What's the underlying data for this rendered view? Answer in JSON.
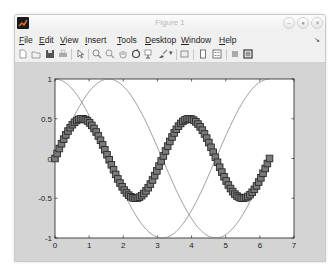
{
  "window": {
    "title": "Figure 1",
    "controls": [
      "minimize",
      "maximize",
      "close"
    ]
  },
  "menu": {
    "items": [
      {
        "label": "File",
        "accel": "F"
      },
      {
        "label": "Edit",
        "accel": "E"
      },
      {
        "label": "View",
        "accel": "V"
      },
      {
        "label": "Insert",
        "accel": "I"
      },
      {
        "label": "Tools",
        "accel": "T"
      },
      {
        "label": "Desktop",
        "accel": "D"
      },
      {
        "label": "Window",
        "accel": "W"
      },
      {
        "label": "Help",
        "accel": "H"
      }
    ],
    "dock_icon": "undock-arrow-icon"
  },
  "toolbar": {
    "items": [
      "new-figure-icon",
      "open-file-icon",
      "save-icon",
      "print-icon",
      "edit-plot-arrow-icon",
      "zoom-in-icon",
      "zoom-out-icon",
      "pan-hand-icon",
      "rotate-3d-icon",
      "data-cursor-icon",
      "brush-icon",
      "link-plot-icon",
      "colorbar-icon",
      "legend-icon",
      "hide-plot-tools-icon",
      "show-plot-tools-icon"
    ]
  },
  "chart_data": {
    "type": "line",
    "title": "",
    "xlabel": "",
    "ylabel": "",
    "xlim": [
      0,
      7
    ],
    "ylim": [
      -1,
      1
    ],
    "xticks": [
      0,
      1,
      2,
      3,
      4,
      5,
      6,
      7
    ],
    "yticks": [
      -1,
      -0.5,
      0,
      0.5,
      1
    ],
    "ytick_labels": [
      "-1",
      "-0.5",
      "0",
      "0.5",
      "1"
    ],
    "grid": false,
    "legend": null,
    "x_range": {
      "start": 0,
      "end": 6.2832,
      "samples": 100
    },
    "series": [
      {
        "name": "sin(x)",
        "style": "line",
        "color": "#777777",
        "expr": "sin",
        "peak": [
          1.5708,
          1
        ],
        "trough": [
          4.7124,
          -1
        ]
      },
      {
        "name": "cos(x)",
        "style": "line",
        "color": "#777777",
        "expr": "cos",
        "peak": [
          0,
          1
        ],
        "trough": [
          3.1416,
          -1
        ]
      },
      {
        "name": "sin(x).*cos(x)",
        "style": "markers",
        "marker": "square",
        "marker_face": "#7a7a7a",
        "marker_edge": "#2a2a2a",
        "expr": "sincos",
        "peaks": [
          [
            0.785,
            0.5
          ],
          [
            3.927,
            0.5
          ]
        ],
        "troughs": [
          [
            2.356,
            -0.5
          ],
          [
            5.498,
            -0.5
          ]
        ]
      }
    ]
  }
}
